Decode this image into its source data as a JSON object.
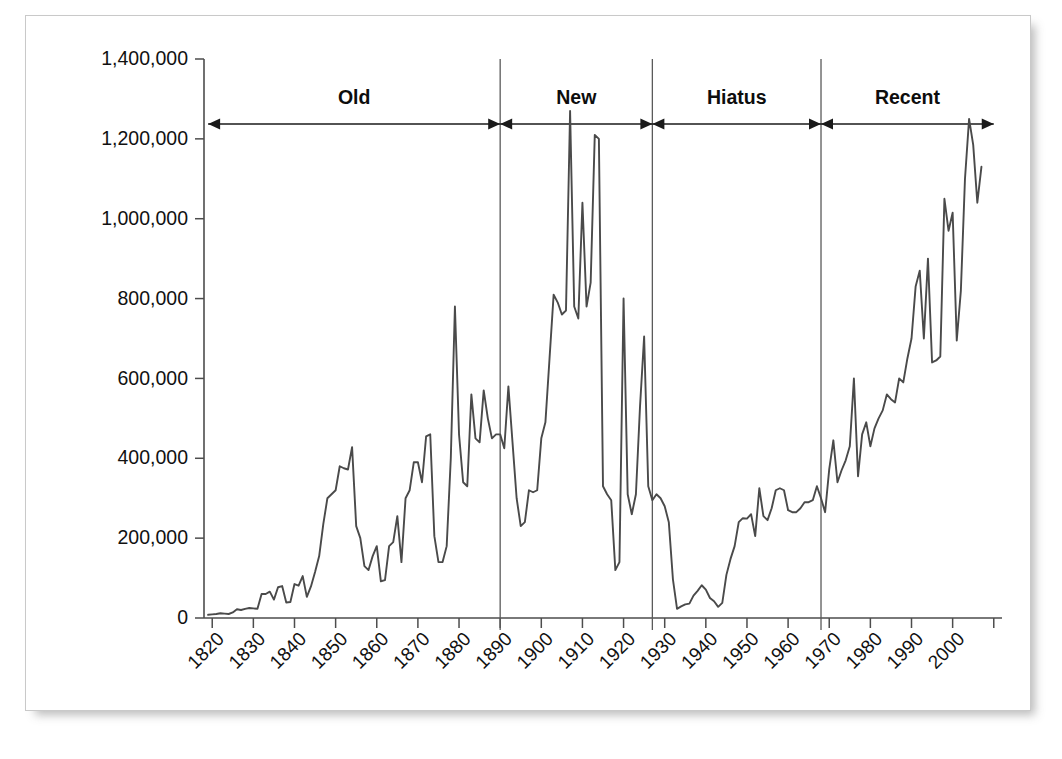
{
  "chart_data": {
    "type": "line",
    "title": "",
    "subtitle": "",
    "xlabel": "",
    "ylabel": "",
    "grid": false,
    "legend": "none",
    "xlim": [
      1818,
      2012
    ],
    "ylim": [
      0,
      1400000
    ],
    "y_ticks": [
      0,
      200000,
      400000,
      600000,
      800000,
      1000000,
      1200000,
      1400000
    ],
    "y_tick_labels": [
      "0",
      "200,000",
      "400,000",
      "600,000",
      "800,000",
      "1,000,000",
      "1,200,000",
      "1,400,000"
    ],
    "x_ticks": [
      1820,
      1830,
      1840,
      1850,
      1860,
      1870,
      1880,
      1890,
      1900,
      1910,
      1920,
      1930,
      1940,
      1950,
      1960,
      1970,
      1980,
      1990,
      2000,
      2010
    ],
    "x_tick_labels": [
      "1820",
      "1830",
      "1840",
      "1850",
      "1860",
      "1870",
      "1880",
      "1890",
      "1900",
      "1910",
      "1920",
      "1930",
      "1940",
      "1950",
      "1960",
      "1970",
      "1980",
      "1990",
      "2000",
      ""
    ],
    "line_color": "#4a4a4a",
    "annotations": {
      "period_dividers": [
        1890,
        1927,
        1968
      ],
      "period_bands": [
        {
          "label": "Old",
          "start": 1819,
          "end": 1890,
          "arrow": "both"
        },
        {
          "label": "New",
          "start": 1890,
          "end": 1927,
          "arrow": "both"
        },
        {
          "label": "Hiatus",
          "start": 1927,
          "end": 1968,
          "arrow": "both"
        },
        {
          "label": "Recent",
          "start": 1968,
          "end": 2010,
          "arrow": "both"
        }
      ]
    },
    "series": [
      {
        "name": "value",
        "x": [
          1819,
          1820,
          1821,
          1822,
          1823,
          1824,
          1825,
          1826,
          1827,
          1828,
          1829,
          1830,
          1831,
          1832,
          1833,
          1834,
          1835,
          1836,
          1837,
          1838,
          1839,
          1840,
          1841,
          1842,
          1843,
          1844,
          1845,
          1846,
          1847,
          1848,
          1849,
          1850,
          1851,
          1852,
          1853,
          1854,
          1855,
          1856,
          1857,
          1858,
          1859,
          1860,
          1861,
          1862,
          1863,
          1864,
          1865,
          1866,
          1867,
          1868,
          1869,
          1870,
          1871,
          1872,
          1873,
          1874,
          1875,
          1876,
          1877,
          1878,
          1879,
          1880,
          1881,
          1882,
          1883,
          1884,
          1885,
          1886,
          1887,
          1888,
          1889,
          1890,
          1891,
          1892,
          1893,
          1894,
          1895,
          1896,
          1897,
          1898,
          1899,
          1900,
          1901,
          1902,
          1903,
          1904,
          1905,
          1906,
          1907,
          1908,
          1909,
          1910,
          1911,
          1912,
          1913,
          1914,
          1915,
          1916,
          1917,
          1918,
          1919,
          1920,
          1921,
          1922,
          1923,
          1924,
          1925,
          1926,
          1927,
          1928,
          1929,
          1930,
          1931,
          1932,
          1933,
          1934,
          1935,
          1936,
          1937,
          1938,
          1939,
          1940,
          1941,
          1942,
          1943,
          1944,
          1945,
          1946,
          1947,
          1948,
          1949,
          1950,
          1951,
          1952,
          1953,
          1954,
          1955,
          1956,
          1957,
          1958,
          1959,
          1960,
          1961,
          1962,
          1963,
          1964,
          1965,
          1966,
          1967,
          1968,
          1969,
          1970,
          1971,
          1972,
          1973,
          1974,
          1975,
          1976,
          1977,
          1978,
          1979,
          1980,
          1981,
          1982,
          1983,
          1984,
          1985,
          1986,
          1987,
          1988,
          1989,
          1990,
          1991,
          1992,
          1993,
          1994,
          1995,
          1996,
          1997,
          1998,
          1999,
          2000,
          2001,
          2002,
          2003,
          2004,
          2005,
          2006,
          2007
        ],
        "values": [
          8000,
          9000,
          10000,
          12000,
          11000,
          10000,
          14000,
          22000,
          20000,
          23000,
          25000,
          24000,
          23000,
          60000,
          60000,
          66000,
          46000,
          77000,
          80000,
          39000,
          40000,
          85000,
          81000,
          105000,
          53000,
          79000,
          115000,
          155000,
          235000,
          300000,
          310000,
          320000,
          380000,
          375000,
          372000,
          428000,
          230000,
          200000,
          130000,
          120000,
          155000,
          180000,
          92000,
          95000,
          180000,
          190000,
          255000,
          140000,
          300000,
          320000,
          390000,
          390000,
          340000,
          455000,
          460000,
          205000,
          140000,
          140000,
          180000,
          400000,
          780000,
          460000,
          340000,
          330000,
          560000,
          450000,
          440000,
          570000,
          500000,
          450000,
          460000,
          460000,
          425000,
          580000,
          440000,
          300000,
          230000,
          240000,
          320000,
          315000,
          320000,
          450000,
          490000,
          650000,
          810000,
          790000,
          760000,
          770000,
          1270000,
          780000,
          750000,
          1040000,
          780000,
          840000,
          1210000,
          1200000,
          330000,
          310000,
          295000,
          120000,
          140000,
          800000,
          310000,
          260000,
          310000,
          530000,
          705000,
          330000,
          295000,
          310000,
          300000,
          280000,
          240000,
          97000,
          23000,
          29000,
          34000,
          36000,
          56000,
          68000,
          82000,
          71000,
          50000,
          42000,
          28000,
          38000,
          108000,
          148000,
          180000,
          240000,
          250000,
          249000,
          260000,
          205000,
          325000,
          255000,
          245000,
          275000,
          320000,
          325000,
          320000,
          270000,
          265000,
          265000,
          275000,
          290000,
          290000,
          295000,
          330000,
          300000,
          265000,
          373000,
          445000,
          340000,
          370000,
          395000,
          430000,
          600000,
          355000,
          460000,
          490000,
          430000,
          475000,
          500000,
          520000,
          560000,
          548000,
          540000,
          600000,
          590000,
          650000,
          700000,
          830000,
          870000,
          700000,
          900000,
          640000,
          645000,
          655000,
          1050000,
          970000,
          1015000,
          695000,
          820000,
          1100000,
          1250000,
          1185000,
          1040000,
          1130000
        ]
      }
    ]
  }
}
